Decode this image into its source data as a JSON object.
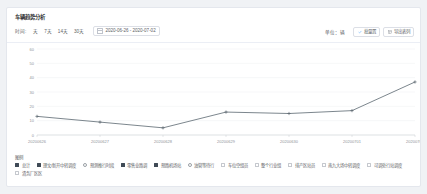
{
  "card": {
    "title": "车辆趋势分析"
  },
  "filter": {
    "label": "时间:",
    "ranges": [
      {
        "label": "天",
        "active": false
      },
      {
        "label": "7天",
        "active": false
      },
      {
        "label": "14天",
        "active": false
      },
      {
        "label": "30天",
        "active": false
      }
    ],
    "date_icon": "calendar-icon",
    "date_range": "2020-06-26 - 2020-07-02",
    "unit_label": "单位：辆",
    "buttons": [
      {
        "label": "批量置",
        "icon": "check-icon",
        "name": "batch-select-button"
      },
      {
        "label": "导出表列",
        "icon": "export-icon",
        "name": "export-button"
      }
    ]
  },
  "chart_data": {
    "type": "line",
    "title": "",
    "xlabel": "",
    "ylabel": "",
    "categories": [
      "20200626",
      "20200627",
      "20200628",
      "20200629",
      "20200630",
      "20200701",
      "20200702"
    ],
    "series": [
      {
        "name": "总计",
        "color": "#5b6770",
        "values": [
          13,
          9,
          5,
          16,
          15,
          17,
          37
        ]
      }
    ],
    "ylim": [
      0,
      60
    ],
    "yticks": [
      0,
      10,
      20,
      30,
      40,
      50,
      60
    ],
    "grid": true,
    "legend_position": "bottom"
  },
  "legend": {
    "title": "图例",
    "row1": [
      {
        "label": "总计",
        "state": "on"
      },
      {
        "label": "理文/新开中转调度",
        "state": "on"
      },
      {
        "label": "预测推行时段",
        "state": "hollow"
      },
      {
        "label": "零售业路调",
        "state": "on"
      },
      {
        "label": "预路机场站",
        "state": "on"
      },
      {
        "label": "油管等待行",
        "state": "hollow"
      },
      {
        "label": "车位空组员",
        "state": "off"
      },
      {
        "label": "整个行业组",
        "state": "off"
      },
      {
        "label": "排产区站员",
        "state": "off"
      },
      {
        "label": "南九大场中转调度",
        "state": "off"
      },
      {
        "label": "可调处行站调度",
        "state": "off"
      }
    ],
    "row2": [
      {
        "label": "清务厂区区",
        "state": "off"
      }
    ]
  }
}
